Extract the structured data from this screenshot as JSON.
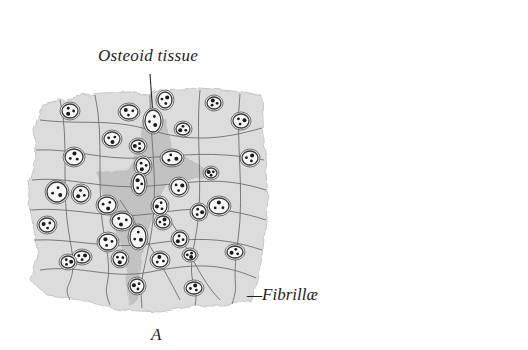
{
  "figure": {
    "type": "histology-illustration",
    "figure_letter": "A",
    "colors": {
      "background": "#ffffff",
      "tissue_fill": "#dcdcdc",
      "tissue_dark": "#b8b8b8",
      "fibril_stroke": "#6e6e6e",
      "cell_stroke": "#3a3a3a",
      "text": "#1e1e1e"
    }
  },
  "labels": {
    "osteoid": "Osteoid tissue",
    "fibrillae": "—Fibrillæ",
    "figure": "A"
  },
  "cells": [
    [
      70,
      111,
      8,
      7
    ],
    [
      129,
      112,
      9,
      7
    ],
    [
      165,
      100,
      7,
      8
    ],
    [
      153,
      121,
      8,
      11
    ],
    [
      183,
      129,
      7,
      6
    ],
    [
      214,
      103,
      7,
      6
    ],
    [
      241,
      121,
      8,
      7
    ],
    [
      112,
      139,
      8,
      7
    ],
    [
      138,
      146,
      7,
      6
    ],
    [
      74,
      157,
      9,
      8
    ],
    [
      172,
      158,
      10,
      7
    ],
    [
      143,
      166,
      7,
      8
    ],
    [
      211,
      173,
      6,
      5
    ],
    [
      250,
      158,
      8,
      7
    ],
    [
      57,
      192,
      10,
      10
    ],
    [
      81,
      194,
      8,
      8
    ],
    [
      139,
      184,
      6,
      10
    ],
    [
      179,
      187,
      8,
      8
    ],
    [
      107,
      205,
      9,
      8
    ],
    [
      160,
      206,
      7,
      8
    ],
    [
      219,
      206,
      10,
      8
    ],
    [
      199,
      212,
      7,
      7
    ],
    [
      122,
      221,
      10,
      8
    ],
    [
      47,
      225,
      8,
      7
    ],
    [
      163,
      222,
      7,
      6
    ],
    [
      138,
      237,
      8,
      11
    ],
    [
      180,
      239,
      7,
      7
    ],
    [
      108,
      242,
      9,
      8
    ],
    [
      82,
      257,
      8,
      6
    ],
    [
      190,
      255,
      6,
      5
    ],
    [
      235,
      252,
      8,
      6
    ],
    [
      160,
      260,
      8,
      7
    ],
    [
      68,
      262,
      7,
      6
    ],
    [
      120,
      259,
      7,
      7
    ],
    [
      137,
      286,
      7,
      7
    ],
    [
      194,
      288,
      8,
      6
    ]
  ]
}
